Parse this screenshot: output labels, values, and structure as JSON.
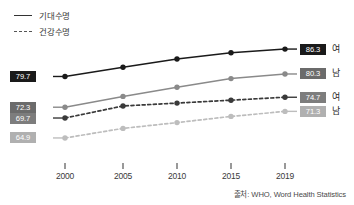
{
  "legend": {
    "items": [
      {
        "label": "기대수명",
        "style": "solid",
        "icon": "solid-line-icon"
      },
      {
        "label": "건강수명",
        "style": "dashed",
        "icon": "dashed-line-icon"
      }
    ]
  },
  "source": {
    "text": "출처: WHO, Word Health Statistics"
  },
  "axis": {
    "ticks": [
      "2000",
      "2005",
      "2010",
      "2015",
      "2019"
    ]
  },
  "left_labels": [
    {
      "value": "79.7",
      "tone": "dark"
    },
    {
      "value": "72.3",
      "tone": "mid"
    },
    {
      "value": "69.7",
      "tone": "midlt"
    },
    {
      "value": "64.9",
      "tone": "light"
    }
  ],
  "right_labels": [
    {
      "value": "86.3",
      "gender": "여",
      "tone": "dark"
    },
    {
      "value": "80.3",
      "gender": "남",
      "tone": "mid"
    },
    {
      "value": "74.7",
      "gender": "여",
      "tone": "midlt"
    },
    {
      "value": "71.3",
      "gender": "남",
      "tone": "light"
    }
  ],
  "colors": {
    "female_life_expectancy": "#1a1a1a",
    "male_life_expectancy": "#8a8a8a",
    "female_healthy_life": "#3a3a3a",
    "male_healthy_life": "#bdbdbd",
    "axis": "#555555",
    "text": "#3a3a3a"
  },
  "chart_data": {
    "type": "line",
    "title": "",
    "subtitle": "",
    "xlabel": "",
    "ylabel": "",
    "x": [
      2000,
      2005,
      2010,
      2015,
      2019
    ],
    "categories": [
      "2000",
      "2005",
      "2010",
      "2015",
      "2019"
    ],
    "ylim": [
      62,
      88
    ],
    "grid": false,
    "legend_position": "top-left",
    "series": [
      {
        "name": "기대수명 여",
        "line_style": "solid",
        "color": "#1a1a1a",
        "values": [
          79.7,
          81.9,
          83.9,
          85.4,
          86.3
        ],
        "start_label": "79.7",
        "end_label": "86.3"
      },
      {
        "name": "기대수명 남",
        "line_style": "solid",
        "color": "#8a8a8a",
        "values": [
          72.3,
          74.9,
          77.1,
          79.2,
          80.3
        ],
        "start_label": "72.3",
        "end_label": "80.3"
      },
      {
        "name": "건강수명 여",
        "line_style": "dashed",
        "color": "#3a3a3a",
        "values": [
          69.7,
          72.6,
          73.3,
          74.0,
          74.7
        ],
        "start_label": "69.7",
        "end_label": "74.7"
      },
      {
        "name": "건강수명 남",
        "line_style": "dashed",
        "color": "#bdbdbd",
        "values": [
          64.9,
          67.2,
          68.6,
          70.1,
          71.3
        ],
        "start_label": "64.9",
        "end_label": "71.3"
      }
    ]
  }
}
